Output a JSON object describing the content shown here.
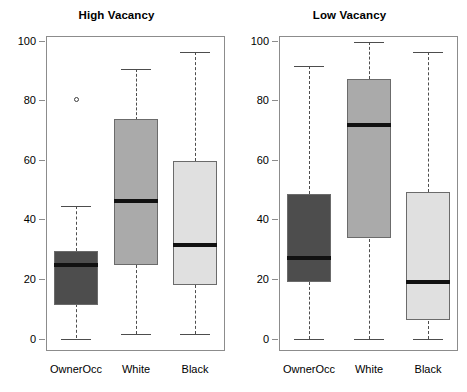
{
  "chart_data": {
    "type": "box",
    "title": "",
    "panels": [
      {
        "title": "High Vacancy",
        "categories": [
          "OwnerOcc",
          "White",
          "Black"
        ],
        "ylabel": "",
        "xlabel": "",
        "ylim": [
          0,
          100
        ],
        "yticks": [
          0,
          20,
          40,
          60,
          80,
          100
        ],
        "ytick_labels": [
          "0",
          "20",
          "40",
          "60",
          "80",
          "100"
        ],
        "grid": false,
        "boxes": [
          {
            "category": "OwnerOcc",
            "whisker_low": 0,
            "q1": 11.5,
            "median": 24.5,
            "q3": 29.5,
            "whisker_high": 44.5,
            "outliers": [
              80
            ],
            "fill": "#4d4d4d"
          },
          {
            "category": "White",
            "whisker_low": 1.5,
            "q1": 24.5,
            "median": 46,
            "q3": 73.5,
            "whisker_high": 90.5,
            "outliers": [],
            "fill": "#aaaaaa"
          },
          {
            "category": "Black",
            "whisker_low": 1.5,
            "q1": 18,
            "median": 31.5,
            "q3": 59.5,
            "whisker_high": 96,
            "outliers": [],
            "fill": "#e0e0e0"
          }
        ]
      },
      {
        "title": "Low Vacancy",
        "categories": [
          "OwnerOcc",
          "White",
          "Black"
        ],
        "ylabel": "",
        "xlabel": "",
        "ylim": [
          0,
          100
        ],
        "yticks": [
          0,
          20,
          40,
          60,
          80,
          100
        ],
        "ytick_labels": [
          "0",
          "20",
          "40",
          "60",
          "80",
          "100"
        ],
        "grid": false,
        "boxes": [
          {
            "category": "OwnerOcc",
            "whisker_low": 0,
            "q1": 19,
            "median": 27,
            "q3": 48.5,
            "whisker_high": 91.5,
            "outliers": [],
            "fill": "#4d4d4d"
          },
          {
            "category": "White",
            "whisker_low": 0,
            "q1": 33.5,
            "median": 71.5,
            "q3": 87,
            "whisker_high": 99.5,
            "outliers": [],
            "fill": "#aaaaaa"
          },
          {
            "category": "Black",
            "whisker_low": 0,
            "q1": 6,
            "median": 19,
            "q3": 49,
            "whisker_high": 96,
            "outliers": [],
            "fill": "#e0e0e0"
          }
        ]
      }
    ],
    "colors": {
      "owner_occ_fill": "#4d4d4d",
      "white_fill": "#aaaaaa",
      "black_fill": "#e0e0e0",
      "box_border": "#6b6b6b",
      "median_line": "#111111",
      "whisker": "#4d4d4d",
      "frame": "#8c8c8c",
      "background": "#ffffff"
    }
  }
}
